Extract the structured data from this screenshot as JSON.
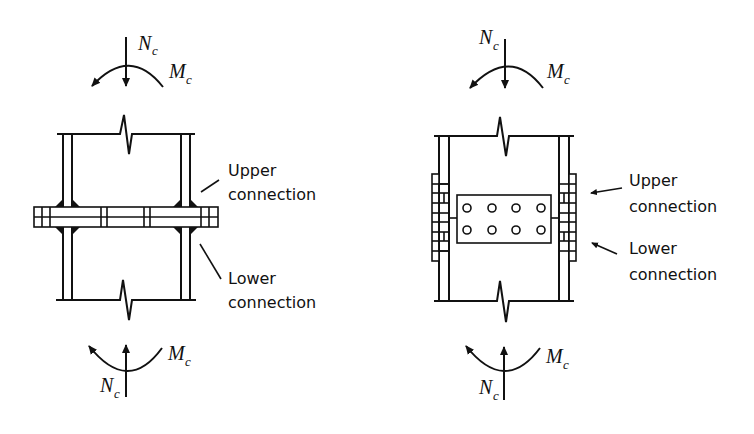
{
  "diagrams": [
    {
      "id": "welded-flange-splice",
      "top_load": {
        "axial_symbol": "N",
        "axial_subscript": "c",
        "moment_symbol": "M",
        "moment_subscript": "c"
      },
      "bottom_load": {
        "axial_symbol": "N",
        "axial_subscript": "c",
        "moment_symbol": "M",
        "moment_subscript": "c"
      },
      "labels": {
        "upper_line1": "Upper",
        "upper_line2": "connection",
        "lower_line1": "Lower",
        "lower_line2": "connection"
      }
    },
    {
      "id": "bolted-web-splice",
      "top_load": {
        "axial_symbol": "N",
        "axial_subscript": "c",
        "moment_symbol": "M",
        "moment_subscript": "c"
      },
      "bottom_load": {
        "axial_symbol": "N",
        "axial_subscript": "c",
        "moment_symbol": "M",
        "moment_subscript": "c"
      },
      "labels": {
        "upper_line1": "Upper",
        "upper_line2": "connection",
        "lower_line1": "Lower",
        "lower_line2": "connection"
      },
      "bolt_grid": {
        "rows": 2,
        "cols": 4
      }
    }
  ]
}
